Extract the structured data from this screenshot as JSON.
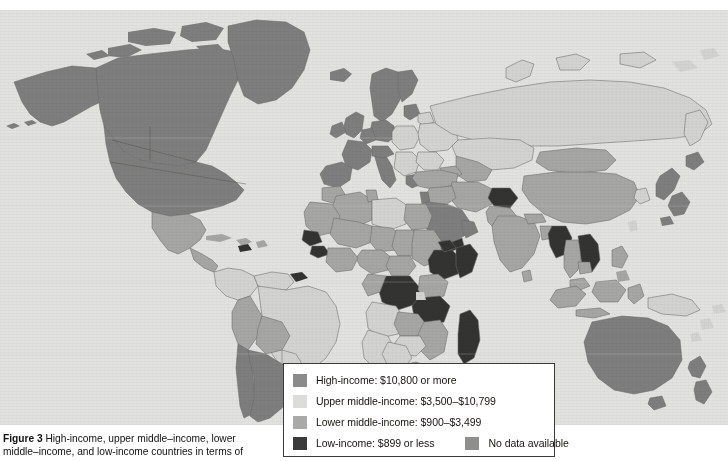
{
  "figure": {
    "number_label": "Figure 3",
    "caption_line_1": "High-income, upper middle–income, lower",
    "caption_line_2": "middle–income, and low-income countries in terms of"
  },
  "legend": {
    "items": [
      {
        "key": "high-income",
        "label": "High-income: $10,800 or more",
        "color": "#8b8b8b"
      },
      {
        "key": "upper-middle-income",
        "label": "Upper middle-income: $3,500–$10,799",
        "color": "#dcdcda"
      },
      {
        "key": "lower-middle-income",
        "label": "Lower middle-income: $900–$3,499",
        "color": "#a9a9a7"
      },
      {
        "key": "low-income",
        "label": "Low-income: $899 or less",
        "color": "#3a3a3a"
      },
      {
        "key": "no-data",
        "label": "No data available",
        "color": "#8e8e8c"
      }
    ]
  },
  "map": {
    "type": "choropleth-world",
    "ocean_color": "#e2e2e0",
    "border_color": "#6a6a68",
    "categories": {
      "high": "#7e7e7e",
      "upper": "#d3d3d1",
      "lower": "#a6a6a4",
      "low": "#333331",
      "nodata": "#8e8e8c"
    },
    "regions": [
      {
        "name": "United States",
        "category": "high"
      },
      {
        "name": "Canada",
        "category": "high"
      },
      {
        "name": "Greenland",
        "category": "high"
      },
      {
        "name": "Mexico",
        "category": "lower"
      },
      {
        "name": "Central America",
        "category": "lower"
      },
      {
        "name": "Caribbean",
        "category": "lower"
      },
      {
        "name": "Brazil",
        "category": "upper"
      },
      {
        "name": "Argentina",
        "category": "high"
      },
      {
        "name": "Chile",
        "category": "high"
      },
      {
        "name": "Bolivia",
        "category": "lower"
      },
      {
        "name": "Peru",
        "category": "lower"
      },
      {
        "name": "Colombia",
        "category": "upper"
      },
      {
        "name": "Venezuela",
        "category": "upper"
      },
      {
        "name": "Western Europe",
        "category": "high"
      },
      {
        "name": "Scandinavia",
        "category": "high"
      },
      {
        "name": "Eastern Europe",
        "category": "upper"
      },
      {
        "name": "Russia",
        "category": "upper"
      },
      {
        "name": "Kazakhstan",
        "category": "upper"
      },
      {
        "name": "Turkey",
        "category": "lower"
      },
      {
        "name": "North Africa",
        "category": "lower"
      },
      {
        "name": "Sahel",
        "category": "lower"
      },
      {
        "name": "West Africa",
        "category": "lower"
      },
      {
        "name": "Ethiopia",
        "category": "low"
      },
      {
        "name": "Somalia",
        "category": "low"
      },
      {
        "name": "Tanzania",
        "category": "low"
      },
      {
        "name": "DR Congo",
        "category": "low"
      },
      {
        "name": "Yemen",
        "category": "low"
      },
      {
        "name": "Madagascar",
        "category": "low"
      },
      {
        "name": "South Africa",
        "category": "lower"
      },
      {
        "name": "Botswana",
        "category": "upper"
      },
      {
        "name": "Namibia",
        "category": "upper"
      },
      {
        "name": "Saudi Arabia",
        "category": "high"
      },
      {
        "name": "India",
        "category": "lower"
      },
      {
        "name": "China",
        "category": "lower"
      },
      {
        "name": "Mongolia",
        "category": "lower"
      },
      {
        "name": "Japan",
        "category": "high"
      },
      {
        "name": "Indonesia",
        "category": "lower"
      },
      {
        "name": "Australia",
        "category": "high"
      },
      {
        "name": "New Zealand",
        "category": "high"
      }
    ]
  }
}
